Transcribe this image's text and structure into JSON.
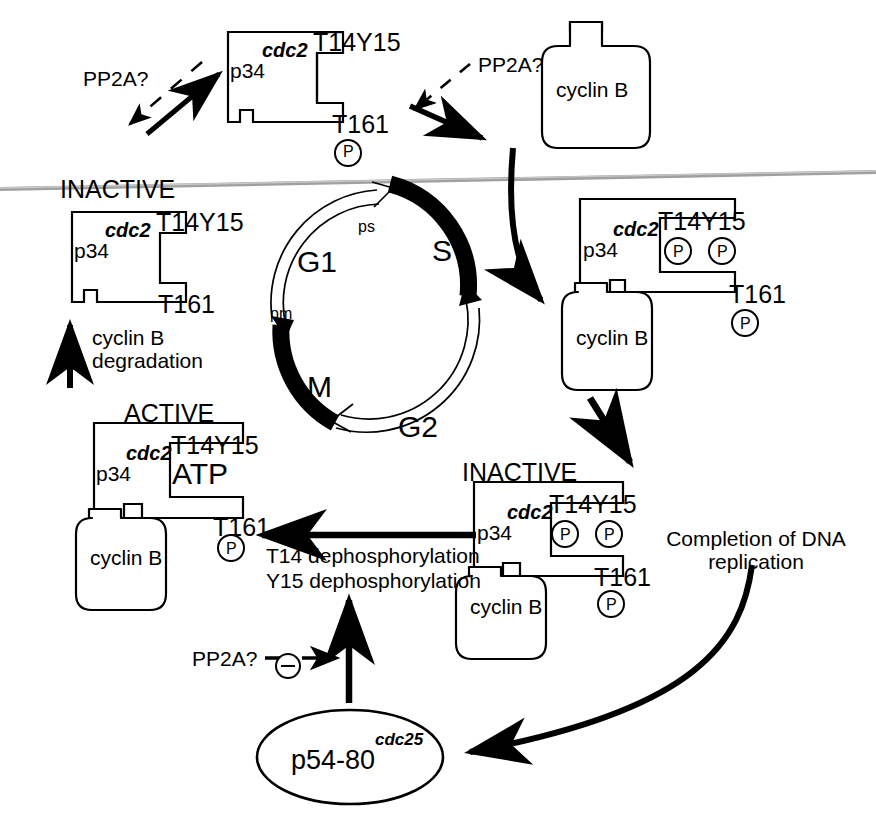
{
  "diagram": {
    "colors": {
      "ink": "#000000",
      "paper": "#ffffff",
      "scan_line": "#9a9a9a"
    }
  },
  "cell_cycle": {
    "phases": [
      {
        "id": "G1",
        "label": "G1",
        "filled": false
      },
      {
        "id": "S",
        "label": "S",
        "filled": true
      },
      {
        "id": "G2",
        "label": "G2",
        "filled": false
      },
      {
        "id": "M",
        "label": "M",
        "filled": true
      }
    ],
    "markers": [
      {
        "id": "ps",
        "label": "ps"
      },
      {
        "id": "pm",
        "label": "pm"
      }
    ]
  },
  "complexes": {
    "top_center": {
      "state_label": "",
      "p34": "p34",
      "cdc2": "cdc2",
      "site_top": "T14Y15",
      "site_top_phosphates": 0,
      "site_bottom": "T161",
      "site_bottom_phosphates": 1,
      "phosphate_glyph": "P",
      "has_cyclin": false,
      "cyclin_label": ""
    },
    "left_inactive": {
      "state_label": "INACTIVE",
      "p34": "p34",
      "cdc2": "cdc2",
      "site_top": "T14Y15",
      "site_top_phosphates": 0,
      "site_bottom": "T161",
      "site_bottom_phosphates": 0,
      "phosphate_glyph": "P",
      "has_cyclin": false,
      "cyclin_label": ""
    },
    "right_upper": {
      "state_label": "",
      "p34": "p34",
      "cdc2": "cdc2",
      "site_top": "T14Y15",
      "site_top_phosphates": 2,
      "site_bottom": "T161",
      "site_bottom_phosphates": 1,
      "phosphate_glyph": "P",
      "has_cyclin": true,
      "cyclin_label": "cyclin B"
    },
    "right_lower_inactive": {
      "state_label": "INACTIVE",
      "p34": "p34",
      "cdc2": "cdc2",
      "site_top": "T14Y15",
      "site_top_phosphates": 2,
      "site_bottom": "T161",
      "site_bottom_phosphates": 1,
      "phosphate_glyph": "P",
      "has_cyclin": true,
      "cyclin_label": "cyclin B"
    },
    "left_active": {
      "state_label": "ACTIVE",
      "p34": "p34",
      "cdc2": "cdc2",
      "site_top": "T14Y15",
      "site_top_extra": "ATP",
      "site_top_phosphates": 0,
      "site_bottom": "T161",
      "site_bottom_phosphates": 1,
      "phosphate_glyph": "P",
      "has_cyclin": true,
      "cyclin_label": "cyclin B"
    }
  },
  "free_cyclin": {
    "label": "cyclin B"
  },
  "annotations": {
    "pp2a_top_left": "PP2A?",
    "pp2a_top_right": "PP2A?",
    "pp2a_bottom": "PP2A?",
    "inhibition_glyph": "⊖",
    "cyclin_degradation_line1": "cyclin B",
    "cyclin_degradation_line2": "degradation",
    "dephos_line1": "T14 dephosphorylation",
    "dephos_line2": "Y15 dephosphorylation",
    "dna_replication_line1": "Completion of DNA",
    "dna_replication_line2": "replication"
  },
  "phosphatase": {
    "name": "p54-80",
    "superscript": "cdc25"
  }
}
